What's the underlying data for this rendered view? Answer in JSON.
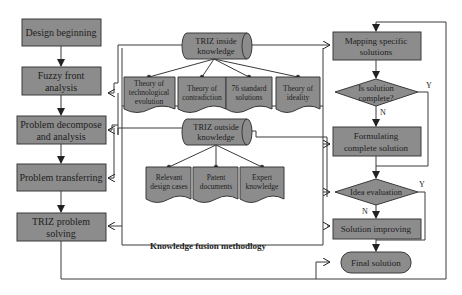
{
  "title": "Knowledge fusion methodlogy",
  "colors": {
    "box": "#8c8c8c",
    "line": "#3a3a3a",
    "text": "#1e1e1e",
    "background": "#ffffff"
  },
  "left_flow": [
    {
      "id": "design-beginning",
      "lines": [
        "Design beginning"
      ]
    },
    {
      "id": "fuzzy-front-analysis",
      "lines": [
        "Fuzzy front",
        "analysis"
      ]
    },
    {
      "id": "problem-decompose",
      "lines": [
        "Problem decompose",
        "and analysis"
      ]
    },
    {
      "id": "problem-transferring",
      "lines": [
        "Problem transferring"
      ]
    },
    {
      "id": "triz-problem-solving",
      "lines": [
        "TRIZ problem",
        "solving"
      ]
    }
  ],
  "inside": {
    "title": [
      "TRIZ inside",
      "knowledge"
    ],
    "docs": [
      [
        "Theory of",
        "technological",
        "evolution"
      ],
      [
        "Theory of",
        "contradiction"
      ],
      [
        "76 standard",
        "solutions"
      ],
      [
        "Theory of",
        "ideality"
      ]
    ]
  },
  "outside": {
    "title": [
      "TRIZ outside",
      "knowledge"
    ],
    "docs": [
      [
        "Relevant",
        "design cases"
      ],
      [
        "Patent",
        "documents"
      ],
      [
        "Expert",
        "knowledge"
      ]
    ]
  },
  "right_flow": {
    "mapping": [
      "Mapping specific",
      "solutions"
    ],
    "is_complete": [
      "Is solution",
      "complete?"
    ],
    "formulating": [
      "Formulating",
      "complete solution"
    ],
    "idea_eval": [
      "Idea evaluation"
    ],
    "improving": [
      "Solution improving"
    ],
    "final": [
      "Final solution"
    ],
    "yes_label": "Y",
    "no_label": "N"
  }
}
